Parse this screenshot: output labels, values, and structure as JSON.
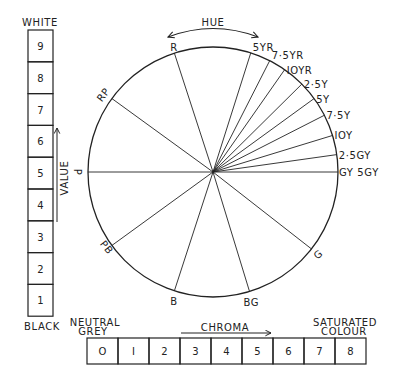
{
  "diagram": {
    "type": "munsell-colour-system",
    "hue_wheel": {
      "title": "HUE",
      "center": [
        213,
        172
      ],
      "radius": 125,
      "hues": [
        {
          "label": "R",
          "angle": 108
        },
        {
          "label": "5YR",
          "angle": 72.4
        },
        {
          "label": "7·5YR",
          "angle": 63
        },
        {
          "label": "IOYR",
          "angle": 55
        },
        {
          "label": "2·5Y",
          "angle": 44.7
        },
        {
          "label": "5Y",
          "angle": 36
        },
        {
          "label": "7·5Y",
          "angle": 27
        },
        {
          "label": "IOY",
          "angle": 17
        },
        {
          "label": "2·5GY",
          "angle": 8
        },
        {
          "label": "GY 5GY",
          "angle": 0
        },
        {
          "label": "G",
          "angle": 322
        },
        {
          "label": "BG",
          "angle": 287
        },
        {
          "label": "B",
          "angle": 252
        },
        {
          "label": "PB",
          "angle": 216
        },
        {
          "label": "P",
          "angle": 180
        },
        {
          "label": "RP",
          "angle": 144
        }
      ]
    },
    "value_scale": {
      "title": "VALUE",
      "top_label": "WHITE",
      "bottom_label": "BLACK",
      "steps": [
        "9",
        "8",
        "7",
        "6",
        "5",
        "4",
        "3",
        "2",
        "1"
      ]
    },
    "chroma_scale": {
      "title": "CHROMA",
      "left_label_line1": "NEUTRAL",
      "left_label_line2": "GREY",
      "right_label_line1": "SATURATED",
      "right_label_line2": "COLOUR",
      "steps": [
        "O",
        "I",
        "2",
        "3",
        "4",
        "5",
        "6",
        "7",
        "8"
      ]
    },
    "colors": {
      "ink": "#222222",
      "background": "#ffffff"
    }
  }
}
